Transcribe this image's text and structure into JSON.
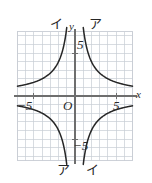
{
  "figure": {
    "title": "",
    "background_color": "#ffffff",
    "grid_color": "#c8cdd4",
    "axis_color": "#6e6e6e",
    "curve_color": "#262626",
    "text_color": "#2b2b2b"
  },
  "axes": {
    "x_axis_label": "x",
    "y_axis_label": "y",
    "origin_label": "O",
    "x_tick_labels": [
      {
        "value": -5,
        "text": "−5"
      },
      {
        "value": 5,
        "text": "5"
      }
    ],
    "y_tick_labels": [
      {
        "value": 5,
        "text": "5"
      },
      {
        "value": -5,
        "text": "−5"
      }
    ]
  },
  "curve_labels": {
    "a_top_right": "ア",
    "a_bottom_left": "ア",
    "i_top_left": "イ",
    "i_bottom_right": "イ"
  },
  "chart_data": {
    "type": "line",
    "title": "",
    "xlabel": "x",
    "ylabel": "y",
    "xlim": [
      -7,
      7
    ],
    "ylim": [
      -7.5,
      7.5
    ],
    "grid": true,
    "grid_step": 1,
    "legend": "none",
    "tick_values_x": [
      -5,
      5
    ],
    "tick_values_y": [
      -5,
      5
    ],
    "series": [
      {
        "name": "ア",
        "equation": "y = 8 / x",
        "coefficient": 8,
        "branches": [
          {
            "quadrant": 1,
            "label": "ア",
            "label_position": "top-right"
          },
          {
            "quadrant": 3,
            "label": "ア",
            "label_position": "bottom-left"
          }
        ],
        "points_q1": [
          {
            "x": 1.15,
            "y": 6.96
          },
          {
            "x": 1.5,
            "y": 5.33
          },
          {
            "x": 2.0,
            "y": 4.0
          },
          {
            "x": 2.5,
            "y": 3.2
          },
          {
            "x": 3.0,
            "y": 2.67
          },
          {
            "x": 4.0,
            "y": 2.0
          },
          {
            "x": 5.0,
            "y": 1.6
          },
          {
            "x": 6.0,
            "y": 1.33
          },
          {
            "x": 7.0,
            "y": 1.14
          }
        ],
        "points_q3": [
          {
            "x": -1.15,
            "y": -6.96
          },
          {
            "x": -1.5,
            "y": -5.33
          },
          {
            "x": -2.0,
            "y": -4.0
          },
          {
            "x": -2.5,
            "y": -3.2
          },
          {
            "x": -3.0,
            "y": -2.67
          },
          {
            "x": -4.0,
            "y": -2.0
          },
          {
            "x": -5.0,
            "y": -1.6
          },
          {
            "x": -6.0,
            "y": -1.33
          },
          {
            "x": -7.0,
            "y": -1.14
          }
        ]
      },
      {
        "name": "イ",
        "equation": "y = -8 / x",
        "coefficient": -8,
        "branches": [
          {
            "quadrant": 2,
            "label": "イ",
            "label_position": "top-left"
          },
          {
            "quadrant": 4,
            "label": "イ",
            "label_position": "bottom-right"
          }
        ],
        "points_q2": [
          {
            "x": -1.15,
            "y": 6.96
          },
          {
            "x": -1.5,
            "y": 5.33
          },
          {
            "x": -2.0,
            "y": 4.0
          },
          {
            "x": -2.5,
            "y": 3.2
          },
          {
            "x": -3.0,
            "y": 2.67
          },
          {
            "x": -4.0,
            "y": 2.0
          },
          {
            "x": -5.0,
            "y": 1.6
          },
          {
            "x": -6.0,
            "y": 1.33
          },
          {
            "x": -7.0,
            "y": 1.14
          }
        ],
        "points_q4": [
          {
            "x": 1.15,
            "y": -6.96
          },
          {
            "x": 1.5,
            "y": -5.33
          },
          {
            "x": 2.0,
            "y": -4.0
          },
          {
            "x": 2.5,
            "y": -3.2
          },
          {
            "x": 3.0,
            "y": -2.67
          },
          {
            "x": 4.0,
            "y": -2.0
          },
          {
            "x": 5.0,
            "y": -1.6
          },
          {
            "x": 6.0,
            "y": -1.33
          },
          {
            "x": 7.0,
            "y": -1.14
          }
        ]
      }
    ]
  }
}
